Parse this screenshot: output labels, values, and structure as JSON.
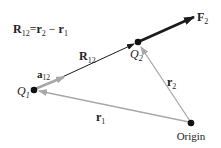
{
  "diagram": {
    "title_equation": {
      "lhs": "R",
      "lhs_sub": "12",
      "equals": "=",
      "term1": "r",
      "term1_sub": "2",
      "minus": "−",
      "term2": "r",
      "term2_sub": "1"
    },
    "points": {
      "q1": {
        "label": "Q",
        "sub": "1",
        "x": 34,
        "y": 90
      },
      "q2": {
        "label": "Q",
        "sub": "2",
        "x": 138,
        "y": 42
      },
      "origin": {
        "label": "Origin",
        "x": 191,
        "y": 123
      }
    },
    "vectors": {
      "R12": {
        "label": "R",
        "sub": "12",
        "color": "#1a1a1a"
      },
      "a12": {
        "label": "a",
        "sub": "12",
        "color": "#9a9a9a"
      },
      "F2": {
        "label": "F",
        "sub": "2",
        "color": "#1a1a1a"
      },
      "r1": {
        "label": "r",
        "sub": "1",
        "color": "#a8a8a8"
      },
      "r2": {
        "label": "r",
        "sub": "2",
        "color": "#a8a8a8"
      }
    },
    "colors": {
      "ink": "#1a1a1a",
      "gray_vector": "#a8a8a8",
      "background": "#ffffff"
    }
  }
}
